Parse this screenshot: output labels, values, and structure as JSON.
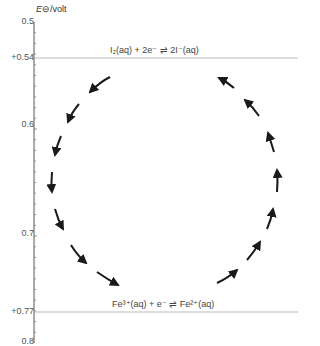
{
  "axis": {
    "title_symbol": "E",
    "title_suffix": "⊖/volt",
    "ticks": [
      {
        "label": "0.5",
        "value": 0.5
      },
      {
        "label": "+0.54",
        "value": 0.54
      },
      {
        "label": "0.6",
        "value": 0.6
      },
      {
        "label": "0.7",
        "value": 0.7
      },
      {
        "label": "+0.77",
        "value": 0.77
      },
      {
        "label": "0.8",
        "value": 0.8
      }
    ],
    "range": [
      0.5,
      0.8
    ],
    "minor_tick_step": 0.01
  },
  "half_reactions": [
    {
      "potential": "+0.54",
      "equation": "I₂(aq) + 2e⁻ ⇌ 2I⁻(aq)"
    },
    {
      "potential": "+0.77",
      "equation": "Fe³⁺(aq) + e⁻ ⇌ Fe²⁺(aq)"
    }
  ],
  "cycle": {
    "direction": "anticlockwise",
    "arrow_count": 14,
    "stroke_color": "#1a1a1a"
  },
  "colors": {
    "axis": "#555555",
    "guide_line": "#aaaaaa",
    "text": "#444444"
  }
}
